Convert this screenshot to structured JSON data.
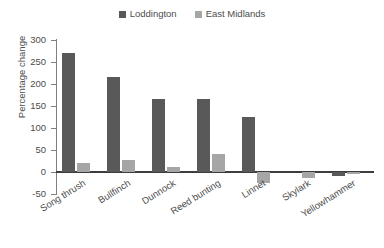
{
  "chart_data": {
    "type": "bar",
    "title": "",
    "subtitle": "",
    "xlabel": "",
    "ylabel": "Percentage change",
    "ylim": [
      -50,
      300
    ],
    "ytick_labels": [
      "300",
      "250",
      "200",
      "150",
      "100",
      "50",
      "0",
      "-50"
    ],
    "ytick_values": [
      300,
      250,
      200,
      150,
      100,
      50,
      0,
      -50
    ],
    "grid": false,
    "legend_position": "top-center",
    "categories": [
      "Song thrush",
      "Bullfinch",
      "Dunnock",
      "Reed bunting",
      "Linnet",
      "Skylark",
      "Yellowhammer"
    ],
    "series": [
      {
        "name": "Loddington",
        "color": "#595959",
        "values": [
          270,
          215,
          166,
          166,
          124,
          0,
          -10
        ]
      },
      {
        "name": "East Midlands",
        "color": "#a6a6a6",
        "values": [
          20,
          27,
          12,
          41,
          -25,
          -14,
          -2
        ]
      }
    ]
  },
  "legend": {
    "entries": [
      {
        "label": "Loddington",
        "color": "#595959"
      },
      {
        "label": "East Midlands",
        "color": "#a6a6a6"
      }
    ]
  }
}
